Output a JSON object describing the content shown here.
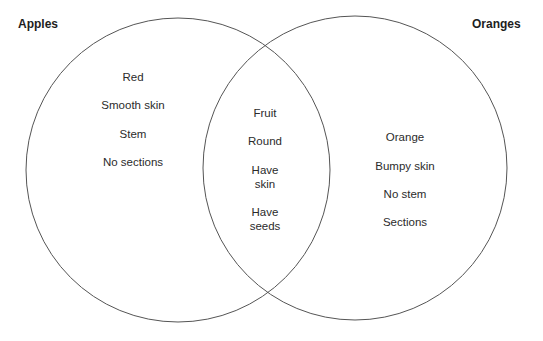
{
  "diagram": {
    "type": "venn",
    "left_set": {
      "label": "Apples",
      "items": [
        "Red",
        "Smooth skin",
        "Stem",
        "No sections"
      ]
    },
    "right_set": {
      "label": "Oranges",
      "items": [
        "Orange",
        "Bumpy skin",
        "No stem",
        "Sections"
      ]
    },
    "overlap": {
      "items": [
        "Fruit",
        "Round",
        "Have skin",
        "Have seeds"
      ],
      "lines": [
        [
          "Fruit"
        ],
        [
          "Round"
        ],
        [
          "Have",
          "skin"
        ],
        [
          "Have",
          "seeds"
        ]
      ]
    },
    "colors": {
      "stroke": "#555555",
      "text": "#2b2b2b",
      "background": "#ffffff"
    }
  }
}
